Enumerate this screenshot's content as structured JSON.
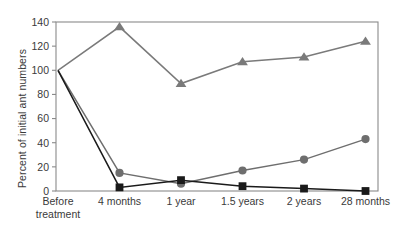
{
  "chart_data": {
    "type": "line",
    "title": "",
    "subtitle": "",
    "xlabel": "",
    "ylabel": "Percent of initial ant numbers",
    "categories": [
      "Before treatment",
      "4 months",
      "1 year",
      "1.5 years",
      "2 years",
      "28 months"
    ],
    "xtick_labels_multiline": [
      [
        "Before",
        "treatment"
      ],
      [
        "4 months"
      ],
      [
        "1 year"
      ],
      [
        "1.5 years"
      ],
      [
        "2 years"
      ],
      [
        "28 months"
      ]
    ],
    "ylim": [
      0,
      140
    ],
    "yticks": [
      0,
      20,
      40,
      60,
      80,
      100,
      120,
      140
    ],
    "ytick_labels": [
      "0",
      "20",
      "40",
      "60",
      "80",
      "100",
      "120",
      "140"
    ],
    "grid": false,
    "legend": "none",
    "series": [
      {
        "name": "untreated-control",
        "marker": "triangle",
        "color": "#7a7a7a",
        "values": [
          100,
          136,
          89,
          107,
          111,
          124
        ]
      },
      {
        "name": "recovering-treatment",
        "marker": "circle",
        "color": "#6e6e6e",
        "values": [
          100,
          15,
          6,
          17,
          26,
          43
        ]
      },
      {
        "name": "sustained-treatment",
        "marker": "square",
        "color": "#1a1a1a",
        "values": [
          100,
          3,
          9,
          4,
          2,
          0
        ]
      }
    ]
  },
  "axes": {
    "frame_color": "#8a8a8a",
    "text_color": "#3a3a3a"
  }
}
